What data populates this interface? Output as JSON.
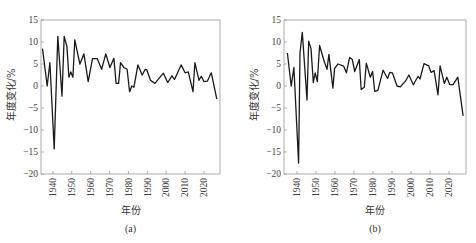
{
  "chart_data": [
    {
      "type": "line",
      "panel_label": "(a)",
      "title": "",
      "xlabel": "年份",
      "ylabel": "年度变化/%",
      "xlim": [
        1933.7,
        2028.5
      ],
      "ylim": [
        -20,
        15
      ],
      "x_ticks": [
        1940,
        1950,
        1960,
        1970,
        1980,
        1990,
        2000,
        2010,
        2020
      ],
      "y_ticks": [
        15,
        10,
        5,
        0,
        -5,
        -10,
        -15,
        -20
      ],
      "grid": false,
      "legend": null,
      "series": [
        {
          "name": "年度变化",
          "x": [
            1934.5,
            1937.0,
            1938.4,
            1940.7,
            1942.6,
            1944.8,
            1946.0,
            1947.4,
            1948.5,
            1949.5,
            1950.6,
            1951.6,
            1954.3,
            1956.4,
            1958.7,
            1961.0,
            1963.5,
            1965.8,
            1968.0,
            1970.2,
            1972.3,
            1973.5,
            1974.8,
            1975.8,
            1977.6,
            1979.3,
            1980.6,
            1981.8,
            1982.9,
            1985.0,
            1987.3,
            1988.9,
            1989.7,
            1991.7,
            1994.0,
            1998.5,
            2000.8,
            2003.0,
            2004.4,
            2007.9,
            2010.0,
            2011.7,
            2014.2,
            2015.2,
            2017.4,
            2018.6,
            2020.0,
            2021.8,
            2023.9,
            2026.8
          ],
          "values": [
            8.5,
            0,
            5.3,
            -14.3,
            11.3,
            -2.3,
            11.3,
            9.0,
            2.0,
            3.2,
            2.0,
            10.5,
            5.0,
            7.3,
            1.0,
            6.2,
            6.2,
            3.8,
            7.3,
            4.2,
            6.3,
            0.6,
            0.6,
            5.3,
            4.2,
            3.8,
            -1.3,
            0,
            -0.3,
            4.8,
            2.5,
            3.8,
            3.7,
            1.3,
            0.6,
            2.9,
            0.8,
            2.3,
            1.5,
            4.8,
            3.0,
            3.2,
            -1.3,
            5.3,
            1.3,
            2.2,
            1.0,
            1.1,
            3.0,
            -3.0
          ]
        }
      ]
    },
    {
      "type": "line",
      "panel_label": "(b)",
      "title": "",
      "xlabel": "年份",
      "ylabel": "年度变化/%",
      "xlim": [
        1933.2,
        2028.9
      ],
      "ylim": [
        -20,
        15
      ],
      "x_ticks": [
        1940,
        1950,
        1960,
        1970,
        1980,
        1990,
        2000,
        2010,
        2020
      ],
      "y_ticks": [
        15,
        10,
        5,
        0,
        -5,
        -10,
        -15,
        -20
      ],
      "grid": false,
      "legend": null,
      "series": [
        {
          "name": "年度变化",
          "x": [
            1935.0,
            1937.0,
            1938.4,
            1940.9,
            1941.6,
            1942.8,
            1945.3,
            1946.2,
            1947.4,
            1948.6,
            1949.6,
            1950.7,
            1951.9,
            1954.4,
            1955.8,
            1956.8,
            1958.9,
            1959.8,
            1961.6,
            1964.6,
            1966.0,
            1967.7,
            1969.1,
            1970.4,
            1972.8,
            1973.8,
            1975.4,
            1976.5,
            1978.6,
            1979.8,
            1980.9,
            1982.6,
            1985.3,
            1987.7,
            1988.8,
            1990.2,
            1992.6,
            1994.4,
            1997.2,
            1998.9,
            2001.2,
            2003.7,
            2004.7,
            2006.8,
            2009.3,
            2010.5,
            2012.1,
            2014.2,
            2015.3,
            2017.5,
            2018.8,
            2020.4,
            2022.1,
            2024.6,
            2027.4
          ],
          "values": [
            7.5,
            0,
            4.2,
            -17.5,
            7.5,
            12.2,
            -3.2,
            10.2,
            8.5,
            0.8,
            3.0,
            1.0,
            9.2,
            5.5,
            3.8,
            7.2,
            -0.5,
            4.0,
            5.0,
            4.5,
            3.0,
            6.5,
            6.0,
            3.3,
            6.0,
            -0.8,
            -0.3,
            5.2,
            2.0,
            3.3,
            -1.2,
            -1.0,
            3.6,
            1.7,
            3.1,
            3.0,
            0,
            -0.2,
            1.2,
            2.5,
            0.3,
            2.2,
            1.6,
            5.1,
            4.6,
            3.1,
            3.5,
            -2.0,
            4.6,
            0.6,
            2.0,
            0.3,
            0.3,
            2.0,
            -6.8
          ]
        }
      ]
    }
  ],
  "panels": [
    {
      "xlabel": "年份",
      "ylabel": "年度变化/%",
      "caption": "(a)"
    },
    {
      "xlabel": "年份",
      "ylabel": "年度变化/%",
      "caption": "(b)"
    }
  ],
  "style": {
    "line_color": "#1a1a1a",
    "frame_color": "#9a9a9a",
    "text_color": "#444444"
  }
}
